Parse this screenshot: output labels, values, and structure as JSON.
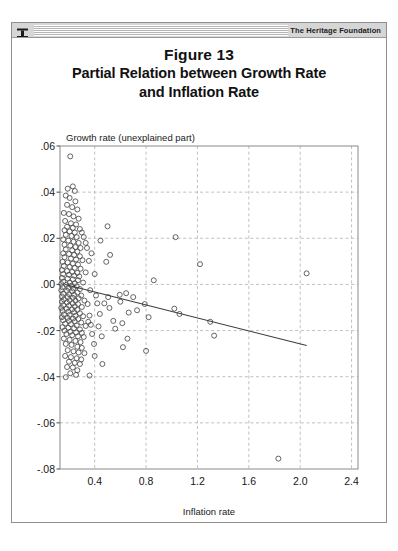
{
  "window": {
    "titlebar_label": "The Heritage Foundation",
    "pin_icon": "pushpin-icon"
  },
  "heading": {
    "line1": "Figure 13",
    "line2": "Partial Relation between Growth Rate",
    "line3": "and Inflation Rate"
  },
  "chart_data": {
    "type": "scatter",
    "title": "Partial Relation between Growth Rate and Inflation Rate",
    "xlabel": "Inflation rate",
    "ylabel": "Growth rate (unexplained part)",
    "xlim": [
      0.13,
      2.45
    ],
    "ylim": [
      -0.08,
      0.06
    ],
    "xticks": [
      "0.4",
      "0.8",
      "1.2",
      "1.6",
      "2.0",
      "2.4"
    ],
    "xtick_values": [
      0.4,
      0.8,
      1.2,
      1.6,
      2.0,
      2.4
    ],
    "yticks": [
      ".06",
      ".04",
      ".02",
      ".00",
      "-.02",
      "-.04",
      "-.06",
      "-.08"
    ],
    "ytick_values": [
      0.06,
      0.04,
      0.02,
      0.0,
      -0.02,
      -0.04,
      -0.06,
      -0.08
    ],
    "grid": true,
    "grid_style": "dashed",
    "legend": "none",
    "marker": "open-circle",
    "marker_color": "#4a4a4a",
    "fit_line": {
      "label": "linear fit",
      "color": "#3b3b3b",
      "x_start": 0.17,
      "y_start": 0.0,
      "x_end": 2.05,
      "y_end": -0.0265
    },
    "points": [
      [
        0.21,
        0.0555
      ],
      [
        0.19,
        0.0415
      ],
      [
        0.23,
        0.0425
      ],
      [
        0.245,
        0.0405
      ],
      [
        0.175,
        0.0385
      ],
      [
        0.205,
        0.0375
      ],
      [
        0.25,
        0.036
      ],
      [
        0.185,
        0.0345
      ],
      [
        0.225,
        0.0335
      ],
      [
        0.265,
        0.0325
      ],
      [
        0.16,
        0.031
      ],
      [
        0.2,
        0.0305
      ],
      [
        0.235,
        0.0295
      ],
      [
        0.275,
        0.0285
      ],
      [
        0.17,
        0.0275
      ],
      [
        0.215,
        0.0265
      ],
      [
        0.255,
        0.026
      ],
      [
        0.185,
        0.025
      ],
      [
        0.23,
        0.0245
      ],
      [
        0.285,
        0.024
      ],
      [
        0.165,
        0.0235
      ],
      [
        0.205,
        0.023
      ],
      [
        0.245,
        0.0225
      ],
      [
        0.3,
        0.0225
      ],
      [
        0.175,
        0.0215
      ],
      [
        0.22,
        0.021
      ],
      [
        0.26,
        0.0205
      ],
      [
        0.315,
        0.0205
      ],
      [
        0.155,
        0.0195
      ],
      [
        0.195,
        0.019
      ],
      [
        0.235,
        0.0185
      ],
      [
        0.275,
        0.018
      ],
      [
        0.33,
        0.018
      ],
      [
        0.165,
        0.0172
      ],
      [
        0.21,
        0.0168
      ],
      [
        0.25,
        0.0162
      ],
      [
        0.29,
        0.0158
      ],
      [
        0.175,
        0.0152
      ],
      [
        0.225,
        0.0148
      ],
      [
        0.265,
        0.0142
      ],
      [
        0.155,
        0.0135
      ],
      [
        0.2,
        0.0132
      ],
      [
        0.24,
        0.0128
      ],
      [
        0.285,
        0.0122
      ],
      [
        0.165,
        0.0118
      ],
      [
        0.215,
        0.0112
      ],
      [
        0.255,
        0.0108
      ],
      [
        0.305,
        0.0105
      ],
      [
        0.15,
        0.0098
      ],
      [
        0.19,
        0.0095
      ],
      [
        0.23,
        0.009
      ],
      [
        0.27,
        0.0086
      ],
      [
        0.16,
        0.008
      ],
      [
        0.205,
        0.0076
      ],
      [
        0.245,
        0.0072
      ],
      [
        0.29,
        0.0068
      ],
      [
        0.145,
        0.0062
      ],
      [
        0.185,
        0.0058
      ],
      [
        0.225,
        0.0054
      ],
      [
        0.265,
        0.005
      ],
      [
        0.155,
        0.0045
      ],
      [
        0.2,
        0.0042
      ],
      [
        0.24,
        0.0038
      ],
      [
        0.28,
        0.0035
      ],
      [
        0.145,
        0.0028
      ],
      [
        0.19,
        0.0025
      ],
      [
        0.23,
        0.0022
      ],
      [
        0.27,
        0.0018
      ],
      [
        0.155,
        0.0012
      ],
      [
        0.205,
        0.0008
      ],
      [
        0.245,
        0.0005
      ],
      [
        0.31,
        0.0008
      ],
      [
        0.14,
        0.0002
      ],
      [
        0.18,
        -0.0002
      ],
      [
        0.22,
        -0.0005
      ],
      [
        0.26,
        -0.0008
      ],
      [
        0.15,
        -0.0012
      ],
      [
        0.195,
        -0.0015
      ],
      [
        0.235,
        -0.0018
      ],
      [
        0.285,
        -0.002
      ],
      [
        0.14,
        -0.0025
      ],
      [
        0.185,
        -0.0028
      ],
      [
        0.225,
        -0.003
      ],
      [
        0.265,
        -0.0035
      ],
      [
        0.155,
        -0.004
      ],
      [
        0.2,
        -0.0042
      ],
      [
        0.24,
        -0.0045
      ],
      [
        0.295,
        -0.0048
      ],
      [
        0.145,
        -0.0052
      ],
      [
        0.19,
        -0.0055
      ],
      [
        0.23,
        -0.0058
      ],
      [
        0.275,
        -0.006
      ],
      [
        0.16,
        -0.0065
      ],
      [
        0.205,
        -0.0068
      ],
      [
        0.25,
        -0.007
      ],
      [
        0.32,
        -0.007
      ],
      [
        0.145,
        -0.0075
      ],
      [
        0.185,
        -0.0078
      ],
      [
        0.228,
        -0.0082
      ],
      [
        0.27,
        -0.0085
      ],
      [
        0.155,
        -0.009
      ],
      [
        0.2,
        -0.0092
      ],
      [
        0.245,
        -0.0095
      ],
      [
        0.3,
        -0.0098
      ],
      [
        0.14,
        -0.0102
      ],
      [
        0.182,
        -0.0105
      ],
      [
        0.225,
        -0.0108
      ],
      [
        0.265,
        -0.011
      ],
      [
        0.15,
        -0.0115
      ],
      [
        0.195,
        -0.0118
      ],
      [
        0.24,
        -0.012
      ],
      [
        0.285,
        -0.0125
      ],
      [
        0.16,
        -0.013
      ],
      [
        0.205,
        -0.0132
      ],
      [
        0.25,
        -0.0136
      ],
      [
        0.31,
        -0.0138
      ],
      [
        0.145,
        -0.0142
      ],
      [
        0.19,
        -0.0145
      ],
      [
        0.232,
        -0.0148
      ],
      [
        0.272,
        -0.015
      ],
      [
        0.155,
        -0.0155
      ],
      [
        0.2,
        -0.0158
      ],
      [
        0.245,
        -0.016
      ],
      [
        0.295,
        -0.0165
      ],
      [
        0.17,
        -0.017
      ],
      [
        0.215,
        -0.0172
      ],
      [
        0.26,
        -0.0178
      ],
      [
        0.33,
        -0.018
      ],
      [
        0.15,
        -0.0185
      ],
      [
        0.195,
        -0.0188
      ],
      [
        0.24,
        -0.019
      ],
      [
        0.285,
        -0.0195
      ],
      [
        0.165,
        -0.02
      ],
      [
        0.21,
        -0.0205
      ],
      [
        0.255,
        -0.0208
      ],
      [
        0.3,
        -0.021
      ],
      [
        0.18,
        -0.0215
      ],
      [
        0.225,
        -0.022
      ],
      [
        0.27,
        -0.0225
      ],
      [
        0.315,
        -0.0228
      ],
      [
        0.16,
        -0.0235
      ],
      [
        0.205,
        -0.024
      ],
      [
        0.25,
        -0.0245
      ],
      [
        0.29,
        -0.025
      ],
      [
        0.175,
        -0.0258
      ],
      [
        0.22,
        -0.0262
      ],
      [
        0.265,
        -0.027
      ],
      [
        0.3,
        -0.0275
      ],
      [
        0.19,
        -0.0285
      ],
      [
        0.235,
        -0.029
      ],
      [
        0.275,
        -0.0295
      ],
      [
        0.32,
        -0.0298
      ],
      [
        0.17,
        -0.031
      ],
      [
        0.215,
        -0.0315
      ],
      [
        0.26,
        -0.032
      ],
      [
        0.295,
        -0.0325
      ],
      [
        0.2,
        -0.0335
      ],
      [
        0.245,
        -0.034
      ],
      [
        0.285,
        -0.0345
      ],
      [
        0.185,
        -0.0358
      ],
      [
        0.23,
        -0.036
      ],
      [
        0.265,
        -0.0372
      ],
      [
        0.21,
        -0.0385
      ],
      [
        0.255,
        -0.0392
      ],
      [
        0.36,
        -0.0395
      ],
      [
        0.175,
        -0.0402
      ],
      [
        0.345,
        -0.0085
      ],
      [
        0.36,
        -0.0135
      ],
      [
        0.35,
        -0.0162
      ],
      [
        0.37,
        -0.0175
      ],
      [
        0.38,
        -0.0215
      ],
      [
        0.395,
        -0.0258
      ],
      [
        0.4,
        -0.031
      ],
      [
        0.42,
        -0.0082
      ],
      [
        0.44,
        -0.0128
      ],
      [
        0.43,
        -0.0182
      ],
      [
        0.455,
        -0.0225
      ],
      [
        0.46,
        -0.0345
      ],
      [
        0.5,
        0.0252
      ],
      [
        0.52,
        0.0128
      ],
      [
        0.505,
        -0.0055
      ],
      [
        0.515,
        -0.0102
      ],
      [
        0.545,
        -0.0158
      ],
      [
        0.56,
        -0.0192
      ],
      [
        0.595,
        -0.0045
      ],
      [
        0.6,
        -0.0075
      ],
      [
        0.615,
        -0.0168
      ],
      [
        0.645,
        -0.0038
      ],
      [
        0.665,
        -0.0122
      ],
      [
        0.655,
        -0.0235
      ],
      [
        0.7,
        -0.0055
      ],
      [
        0.73,
        -0.0112
      ],
      [
        0.79,
        -0.0085
      ],
      [
        0.82,
        -0.0142
      ],
      [
        0.8,
        -0.0288
      ],
      [
        0.86,
        0.0018
      ],
      [
        1.03,
        0.0205
      ],
      [
        1.02,
        -0.0105
      ],
      [
        1.06,
        -0.0128
      ],
      [
        1.22,
        0.0088
      ],
      [
        1.3,
        -0.0162
      ],
      [
        1.33,
        -0.0222
      ],
      [
        1.83,
        -0.0755
      ],
      [
        2.05,
        0.0048
      ],
      [
        0.445,
        0.019
      ],
      [
        0.49,
        0.0098
      ],
      [
        0.4,
        0.0045
      ],
      [
        0.355,
        0.0102
      ],
      [
        0.375,
        0.0135
      ],
      [
        0.34,
        0.0158
      ],
      [
        0.33,
        0.0052
      ],
      [
        0.365,
        -0.0025
      ],
      [
        0.41,
        -0.0048
      ],
      [
        0.475,
        -0.0082
      ],
      [
        0.62,
        -0.0272
      ]
    ]
  }
}
